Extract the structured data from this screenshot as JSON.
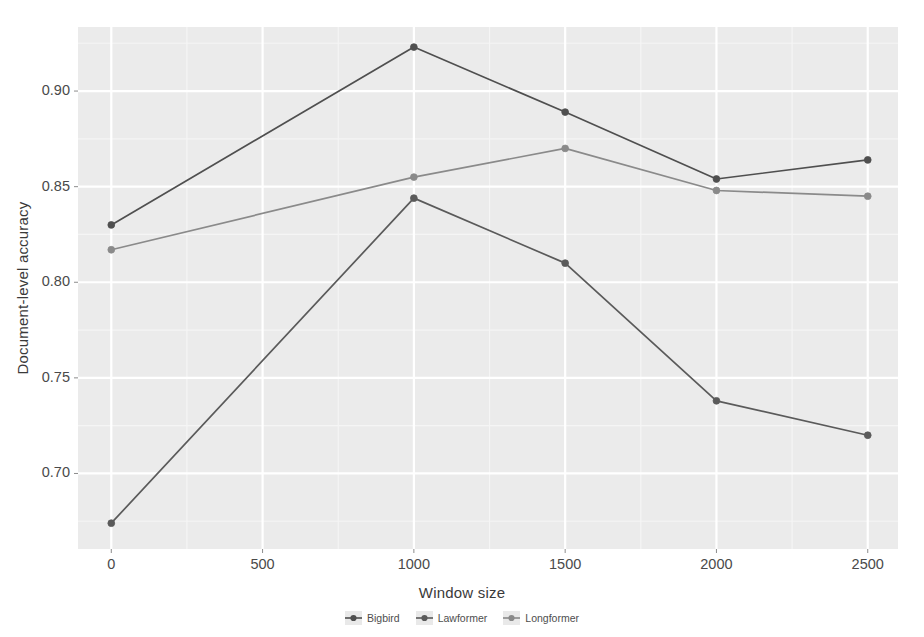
{
  "chart_data": {
    "type": "line",
    "title": "",
    "xlabel": "Window size",
    "ylabel": "Document-level accuracy",
    "x": [
      0,
      1000,
      1500,
      2000,
      2500
    ],
    "xlim": [
      -110,
      2600
    ],
    "ylim": [
      0.6605,
      0.9335
    ],
    "xticks": [
      0,
      500,
      1000,
      1500,
      2000,
      2500
    ],
    "xtick_labels": [
      "0",
      "500",
      "1000",
      "1500",
      "2000",
      "2500"
    ],
    "yticks": [
      0.7,
      0.75,
      0.8,
      0.85,
      0.9
    ],
    "ytick_labels": [
      "0.70",
      "0.75",
      "0.80",
      "0.85",
      "0.90"
    ],
    "grid": true,
    "panel_background": "#ebebeb",
    "major_grid_color": "#ffffff",
    "minor_grid_color": "#f5f5f5",
    "legend_position": "bottom",
    "series": [
      {
        "name": "Bigbird",
        "color": "#4f4f4f",
        "values": [
          0.83,
          0.923,
          0.889,
          0.854,
          0.864
        ]
      },
      {
        "name": "Lawformer",
        "color": "#5a5a5a",
        "values": [
          0.674,
          0.844,
          0.81,
          0.738,
          0.72
        ]
      },
      {
        "name": "Longformer",
        "color": "#8a8a8a",
        "values": [
          0.817,
          0.855,
          0.87,
          0.848,
          0.845
        ]
      }
    ]
  },
  "legend": {
    "items": [
      {
        "label": "Bigbird",
        "icon": "point-marker-icon",
        "color": "#4f4f4f"
      },
      {
        "label": "Lawformer",
        "icon": "point-marker-icon",
        "color": "#5a5a5a"
      },
      {
        "label": "Longformer",
        "icon": "point-marker-icon",
        "color": "#8a8a8a"
      }
    ]
  }
}
